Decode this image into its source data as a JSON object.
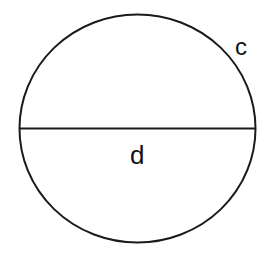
{
  "diagram": {
    "stroke_color": "#1a1a1a",
    "background": "#ffffff",
    "circle": {
      "cx": 137.5,
      "cy": 128.5,
      "rx": 118,
      "ry": 114,
      "stroke_width": 2
    },
    "diameter_line": {
      "x1": 19.5,
      "y1": 128.5,
      "x2": 255.5,
      "y2": 128.5,
      "stroke_width": 2
    },
    "labels": {
      "circumference": {
        "text": "c",
        "x": 235,
        "y": 55,
        "font_size": 24
      },
      "diameter": {
        "text": "d",
        "x": 130,
        "y": 164,
        "font_size": 26
      }
    }
  }
}
